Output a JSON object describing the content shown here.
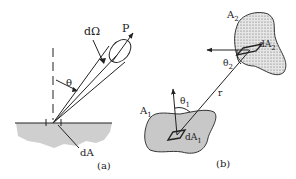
{
  "figure": {
    "panel_a": {
      "caption": "(a)",
      "labels": {
        "solid_angle": "dΩ",
        "direction": "P",
        "angle": "θ",
        "area": "dA"
      }
    },
    "panel_b": {
      "caption": "(b)",
      "labels": {
        "surface1": "A",
        "surface1_sub": "1",
        "surface2": "A",
        "surface2_sub": "2",
        "area1": "dA",
        "area1_sub": "1",
        "area2": "dA",
        "area2_sub": "2",
        "angle1": "θ",
        "angle1_sub": "1",
        "angle2": "θ",
        "angle2_sub": "2",
        "distance": "r"
      }
    },
    "colors": {
      "surface_fill": "#c8c8c8",
      "line": "#222222",
      "background": "#ffffff"
    }
  }
}
